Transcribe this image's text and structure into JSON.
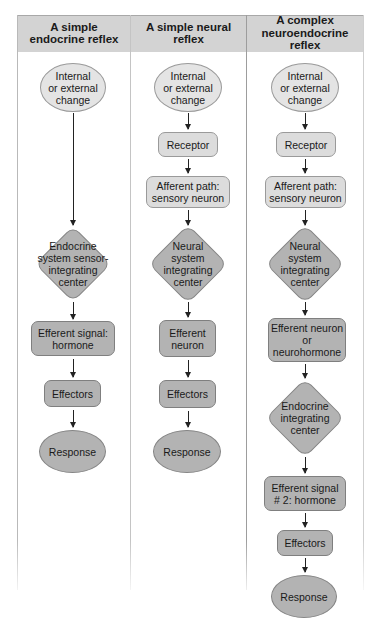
{
  "columns": [
    {
      "title": "A simple\nendocrine reflex",
      "steps": {
        "stimulus": "Internal\nor external\nchange",
        "integrator": "Endocrine\nsystem sensor-\nintegrating\ncenter",
        "efferent": "Efferent signal:\nhormone",
        "effectors": "Effectors",
        "response": "Response"
      }
    },
    {
      "title": "A simple neural\nreflex",
      "steps": {
        "stimulus": "Internal\nor external\nchange",
        "receptor": "Receptor",
        "afferent": "Afferent path:\nsensory neuron",
        "integrator": "Neural\nsystem\nintegrating\ncenter",
        "efferent": "Efferent\nneuron",
        "effectors": "Effectors",
        "response": "Response"
      }
    },
    {
      "title": "A complex\nneuroendocrine reflex",
      "steps": {
        "stimulus": "Internal\nor external\nchange",
        "receptor": "Receptor",
        "afferent": "Afferent path:\nsensory neuron",
        "integrator": "Neural\nsystem\nintegrating\ncenter",
        "efferent": "Efferent neuron\nor\nneurohormone",
        "integrator2": "Endocrine\nintegrating\ncenter",
        "efferent2": "Efferent signal\n# 2: hormone",
        "effectors": "Effectors",
        "response": "Response"
      }
    }
  ],
  "colors": {
    "header_fill": "#d3d3d3",
    "light_fill": "#e4e4e4",
    "dark_fill": "#b3b3b3",
    "stroke": "#858585"
  }
}
